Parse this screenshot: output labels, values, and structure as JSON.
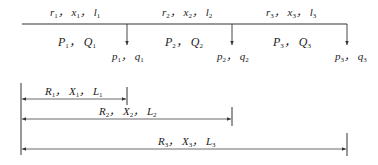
{
  "diagram": {
    "type": "radial distribution feeder with three loads",
    "segments": [
      {
        "params": [
          "r",
          "x",
          "l"
        ],
        "index": "1",
        "flow": [
          "P",
          "Q"
        ]
      },
      {
        "params": [
          "r",
          "x",
          "l"
        ],
        "index": "2",
        "flow": [
          "P",
          "Q"
        ]
      },
      {
        "params": [
          "r",
          "x",
          "l"
        ],
        "index": "3",
        "flow": [
          "P",
          "Q"
        ]
      }
    ],
    "loads": [
      {
        "symbols": [
          "p",
          "q"
        ],
        "index": "1"
      },
      {
        "symbols": [
          "p",
          "q"
        ],
        "index": "2"
      },
      {
        "symbols": [
          "p",
          "q"
        ],
        "index": "3"
      }
    ],
    "cumulative": [
      {
        "symbols": [
          "R",
          "X",
          "L"
        ],
        "index": "1"
      },
      {
        "symbols": [
          "R",
          "X",
          "L"
        ],
        "index": "2"
      },
      {
        "symbols": [
          "R",
          "X",
          "L"
        ],
        "index": "3"
      }
    ],
    "separator": "，",
    "colors": {
      "line": "#333333",
      "background": "#ffffff"
    }
  }
}
